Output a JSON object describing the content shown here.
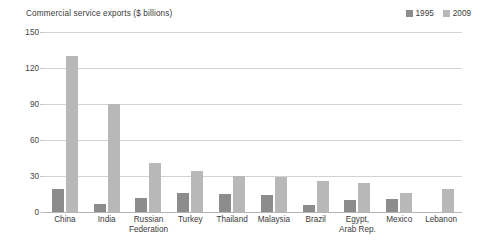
{
  "chart_data": {
    "type": "bar",
    "title": "Commercial service exports ($ billions)",
    "xlabel": "",
    "ylabel": "",
    "ylim": [
      0,
      150
    ],
    "yticks": [
      0,
      30,
      60,
      90,
      120,
      150
    ],
    "grid": true,
    "legend_position": "top-right",
    "categories": [
      "China",
      "India",
      "Russian Federation",
      "Turkey",
      "Thailand",
      "Malaysia",
      "Brazil",
      "Egypt, Arab Rep.",
      "Mexico",
      "Lebanon"
    ],
    "category_lines": [
      [
        "China"
      ],
      [
        "India"
      ],
      [
        "Russian",
        "Federation"
      ],
      [
        "Turkey"
      ],
      [
        "Thailand"
      ],
      [
        "Malaysia"
      ],
      [
        "Brazil"
      ],
      [
        "Egypt,",
        "Arab Rep."
      ],
      [
        "Mexico"
      ],
      [
        "Lebanon"
      ]
    ],
    "series": [
      {
        "name": "1995",
        "color": "#8c8c8c",
        "values": [
          19,
          7,
          12,
          16,
          15,
          14,
          6,
          10,
          11,
          null
        ]
      },
      {
        "name": "2009",
        "color": "#b8b8b8",
        "values": [
          130,
          90,
          41,
          34,
          30,
          29,
          26,
          24,
          16,
          19
        ]
      }
    ]
  },
  "colors": {
    "background": "#ffffff",
    "grid": "#d2d2d2",
    "axis": "#b4b4b4",
    "text": "#3a3a3a",
    "series_1995": "#8c8c8c",
    "series_2009": "#b8b8b8"
  }
}
